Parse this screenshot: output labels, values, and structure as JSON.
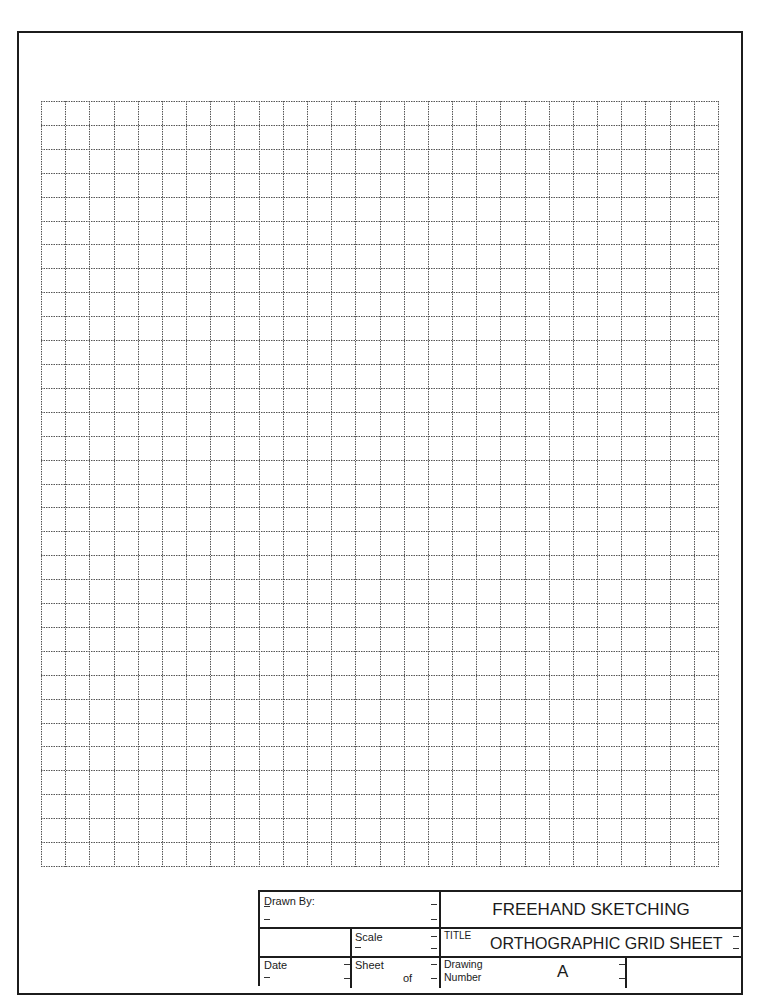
{
  "sheet": {
    "grid": {
      "columns": 28,
      "rows": 32,
      "line_color": "#555555",
      "line_style": "dotted"
    },
    "border_color": "#1c1c1c"
  },
  "title_block": {
    "drawn_by_label": "Drawn By:",
    "scale_label": "Scale",
    "date_label": "Date",
    "sheet_label": "Sheet",
    "sheet_of_label": "of",
    "course_title": "FREEHAND SKETCHING",
    "title_label": "TITLE",
    "title_value": "ORTHOGRAPHIC GRID SHEET",
    "drawing_number_label_line1": "Drawing",
    "drawing_number_label_line2": "Number",
    "drawing_number_value": "A"
  }
}
